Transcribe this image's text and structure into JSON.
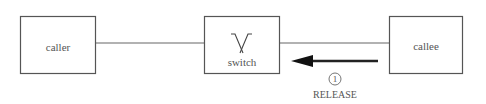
{
  "nodes": {
    "caller": {
      "label": "caller"
    },
    "switch": {
      "label": "switch",
      "icon": "crossover-switch-icon"
    },
    "callee": {
      "label": "callee"
    }
  },
  "message": {
    "step_number": "1",
    "label": "RELEASE",
    "direction": "callee-to-switch"
  },
  "colors": {
    "stroke": "#555555",
    "arrow": "#222222",
    "text": "#555555"
  }
}
